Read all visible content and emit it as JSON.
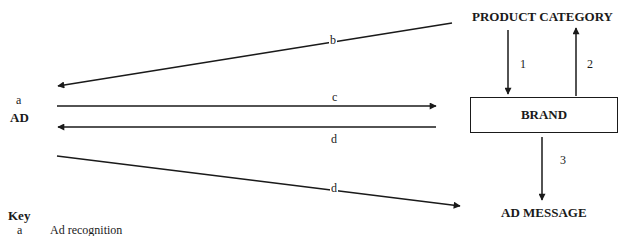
{
  "diagram": {
    "nodes": {
      "product_category": {
        "label": "PRODUCT CATEGORY"
      },
      "brand": {
        "label": "BRAND"
      },
      "ad_message": {
        "label": "AD MESSAGE"
      },
      "ad": {
        "label": "AD",
        "marker": "a"
      }
    },
    "edges": [
      {
        "id": "b",
        "label": "b",
        "from": "product_category",
        "to": "ad"
      },
      {
        "id": "c",
        "label": "c",
        "from": "ad",
        "to": "brand"
      },
      {
        "id": "d1",
        "label": "d",
        "from": "brand",
        "to": "ad"
      },
      {
        "id": "d2",
        "label": "d",
        "from": "ad",
        "to": "ad_message"
      },
      {
        "id": "1",
        "label": "1",
        "from": "product_category",
        "to": "brand"
      },
      {
        "id": "2",
        "label": "2",
        "from": "brand",
        "to": "product_category"
      },
      {
        "id": "3",
        "label": "3",
        "from": "brand",
        "to": "ad_message"
      }
    ]
  },
  "key": {
    "title": "Key",
    "items": [
      {
        "symbol": "a",
        "description": "Ad recognition"
      }
    ]
  },
  "colors": {
    "ink": "#1a1a1a",
    "background": "#ffffff"
  }
}
